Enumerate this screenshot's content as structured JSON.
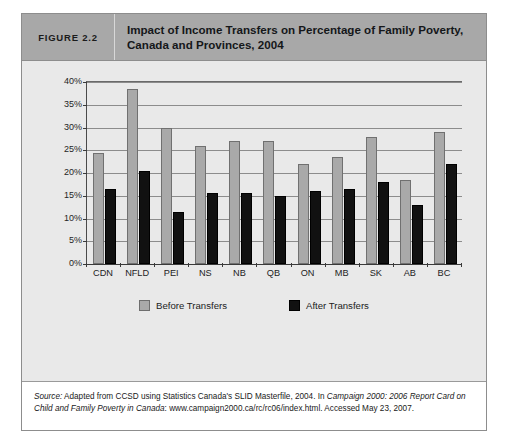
{
  "figure": {
    "number_label": "FIGURE 2.2",
    "title": "Impact of Income Transfers on Percentage of Family Poverty, Canada and Provinces, 2004",
    "source_prefix": "Source:",
    "source_text_1": " Adapted from CCSD using Statistics Canada's SLID Masterfile, 2004. In ",
    "source_italic_1": "Campaign 2000: 2006 Report Card on Child and Family Poverty in Canada",
    "source_text_2": ": www.campaign2000.ca/rc/rc06/index.html. Accessed May 23, 2007."
  },
  "colors": {
    "before_transfers": "#a9a9a9",
    "after_transfers": "#111111",
    "header_band": "#a8a8a8",
    "panel_background": "#e9e9e9",
    "gridline": "#8c8c8c"
  },
  "chart_data": {
    "type": "bar",
    "title": "Impact of Income Transfers on Percentage of Family Poverty, Canada and Provinces, 2004",
    "xlabel": "",
    "ylabel": "",
    "ylim": [
      0,
      40
    ],
    "yticks": [
      0,
      5,
      10,
      15,
      20,
      25,
      30,
      35,
      40
    ],
    "ytick_labels": [
      "0%",
      "5%",
      "10%",
      "15%",
      "20%",
      "25%",
      "30%",
      "35%",
      "40%"
    ],
    "grid": true,
    "legend_position": "bottom-center",
    "categories": [
      "CDN",
      "NFLD",
      "PEI",
      "NS",
      "NB",
      "QB",
      "ON",
      "MB",
      "SK",
      "AB",
      "BC"
    ],
    "series": [
      {
        "name": "Before Transfers",
        "color": "#a9a9a9",
        "values": [
          24.5,
          38.5,
          30,
          26,
          27,
          27,
          22,
          23.5,
          28,
          18.5,
          29
        ]
      },
      {
        "name": "After Transfers",
        "color": "#111111",
        "values": [
          16.5,
          20.5,
          11.5,
          15.5,
          15.5,
          15,
          16,
          16.5,
          18,
          13,
          22
        ]
      }
    ]
  }
}
